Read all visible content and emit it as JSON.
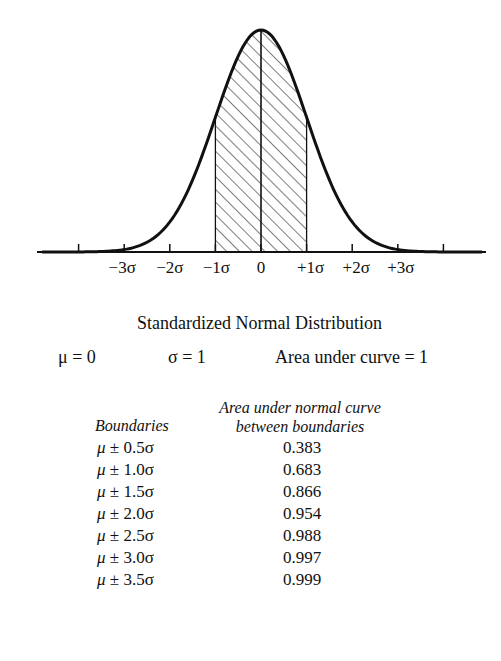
{
  "chart_data": {
    "type": "area",
    "title": "Standardized Normal Distribution",
    "subtitle": "μ = 0   σ = 1   Area under curve = 1",
    "xlabel": "",
    "ylabel": "",
    "x_ticks": [
      -4,
      -3,
      -2,
      -1,
      0,
      1,
      2,
      3,
      4
    ],
    "x_tick_labels": [
      "−3σ",
      "−2σ",
      "−1σ",
      "0",
      "+1σ",
      "+2σ",
      "+3σ"
    ],
    "x_tick_label_values": [
      -3,
      -2,
      -1,
      0,
      1,
      2,
      3
    ],
    "xlim": [
      -4.8,
      5.0
    ],
    "curve": "standard normal density",
    "shaded_region": {
      "from": -1,
      "to": 1,
      "pattern": "diagonal hatch"
    },
    "center_line": 0,
    "grid": false,
    "legend": null,
    "table": {
      "columns": [
        "Boundaries",
        "Area under normal curve between boundaries"
      ],
      "rows": [
        {
          "boundary": "μ ± 0.5σ",
          "area": 0.383
        },
        {
          "boundary": "μ ± 1.0σ",
          "area": 0.683
        },
        {
          "boundary": "μ ± 1.5σ",
          "area": 0.866
        },
        {
          "boundary": "μ ± 2.0σ",
          "area": 0.954
        },
        {
          "boundary": "μ ± 2.5σ",
          "area": 0.988
        },
        {
          "boundary": "μ ± 3.0σ",
          "area": 0.997
        },
        {
          "boundary": "μ ± 3.5σ",
          "area": 0.999
        }
      ]
    }
  },
  "title": "Standardized Normal Distribution",
  "params": {
    "mu": "μ = 0",
    "sigma": "σ = 1",
    "area": "Area under curve = 1"
  },
  "table": {
    "header_area_line1": "Area under normal curve",
    "header_area_line2": "between boundaries",
    "header_boundaries": "Boundaries",
    "rows": [
      {
        "mu": "μ",
        "rest": " ± 0.5σ",
        "area": "0.383"
      },
      {
        "mu": "μ",
        "rest": " ± 1.0σ",
        "area": "0.683"
      },
      {
        "mu": "μ",
        "rest": " ± 1.5σ",
        "area": "0.866"
      },
      {
        "mu": "μ",
        "rest": " ± 2.0σ",
        "area": "0.954"
      },
      {
        "mu": "μ",
        "rest": " ± 2.5σ",
        "area": "0.988"
      },
      {
        "mu": "μ",
        "rest": " ± 3.0σ",
        "area": "0.997"
      },
      {
        "mu": "μ",
        "rest": " ± 3.5σ",
        "area": "0.999"
      }
    ]
  }
}
